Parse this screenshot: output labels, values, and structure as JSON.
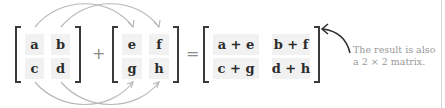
{
  "diagram": {
    "matrix_a": {
      "cells": [
        [
          "a",
          "b"
        ],
        [
          "c",
          "d"
        ]
      ]
    },
    "operator_plus": "+",
    "matrix_b": {
      "cells": [
        [
          "e",
          "f"
        ],
        [
          "g",
          "h"
        ]
      ]
    },
    "operator_equals": "=",
    "matrix_result": {
      "cells": [
        [
          "a + e",
          "b + f"
        ],
        [
          "c + g",
          "d + h"
        ]
      ]
    },
    "annotation": {
      "line1": "The result is also",
      "line2": "a 2 × 2 matrix."
    },
    "colors": {
      "bracket": "#3a3a3a",
      "cell_bg": "#f1f1f1",
      "cell_text": "#2b2b2b",
      "arrow": "#b5b5b5",
      "annotation_arrow": "#2b2b2b",
      "annotation_text": "#9a9a9a"
    }
  }
}
